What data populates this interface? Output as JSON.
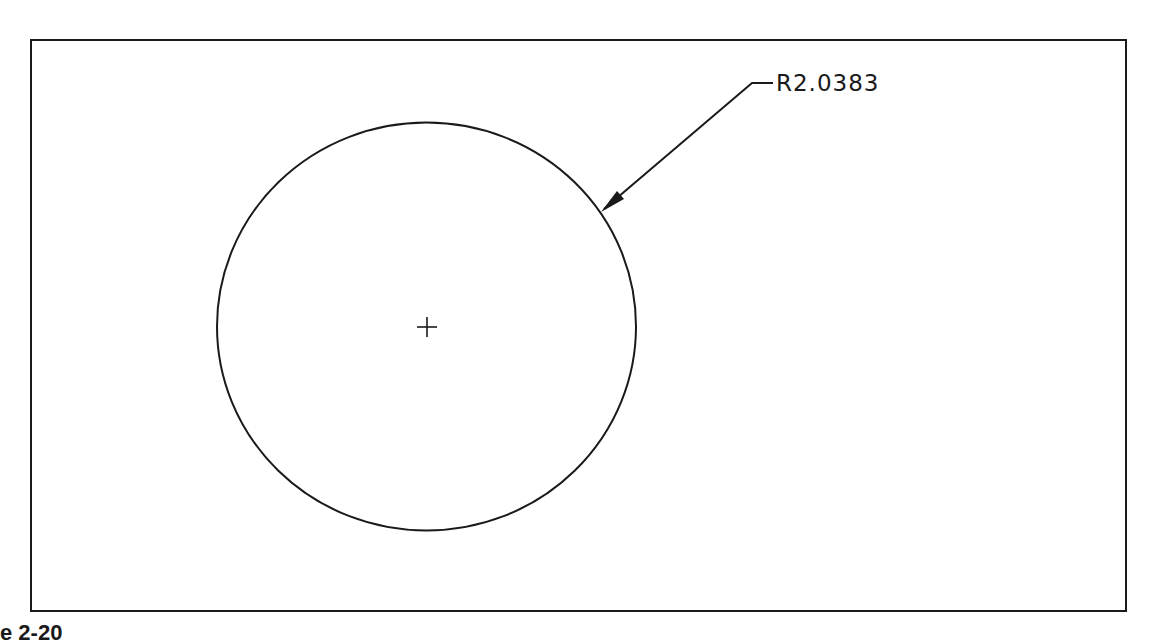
{
  "drawing": {
    "type": "CAD radius dimension drawing",
    "frame": {
      "x": 31,
      "y": 40,
      "width": 1094,
      "height": 570,
      "stroke": "#1a1a1a"
    },
    "circle": {
      "cx": 426.5,
      "cy": 326.5,
      "rx": 209.5,
      "ry": 204,
      "stroke": "#1a1a1a"
    },
    "center_mark": {
      "x": 427,
      "y": 327,
      "arm": 10
    },
    "leader": {
      "arrow_tip": {
        "x": 602,
        "y": 211
      },
      "elbow": {
        "x": 752,
        "y": 83
      },
      "end": {
        "x": 773,
        "y": 83
      }
    },
    "dimension_text": "R2.0383",
    "figure_label": "e 2-20"
  }
}
